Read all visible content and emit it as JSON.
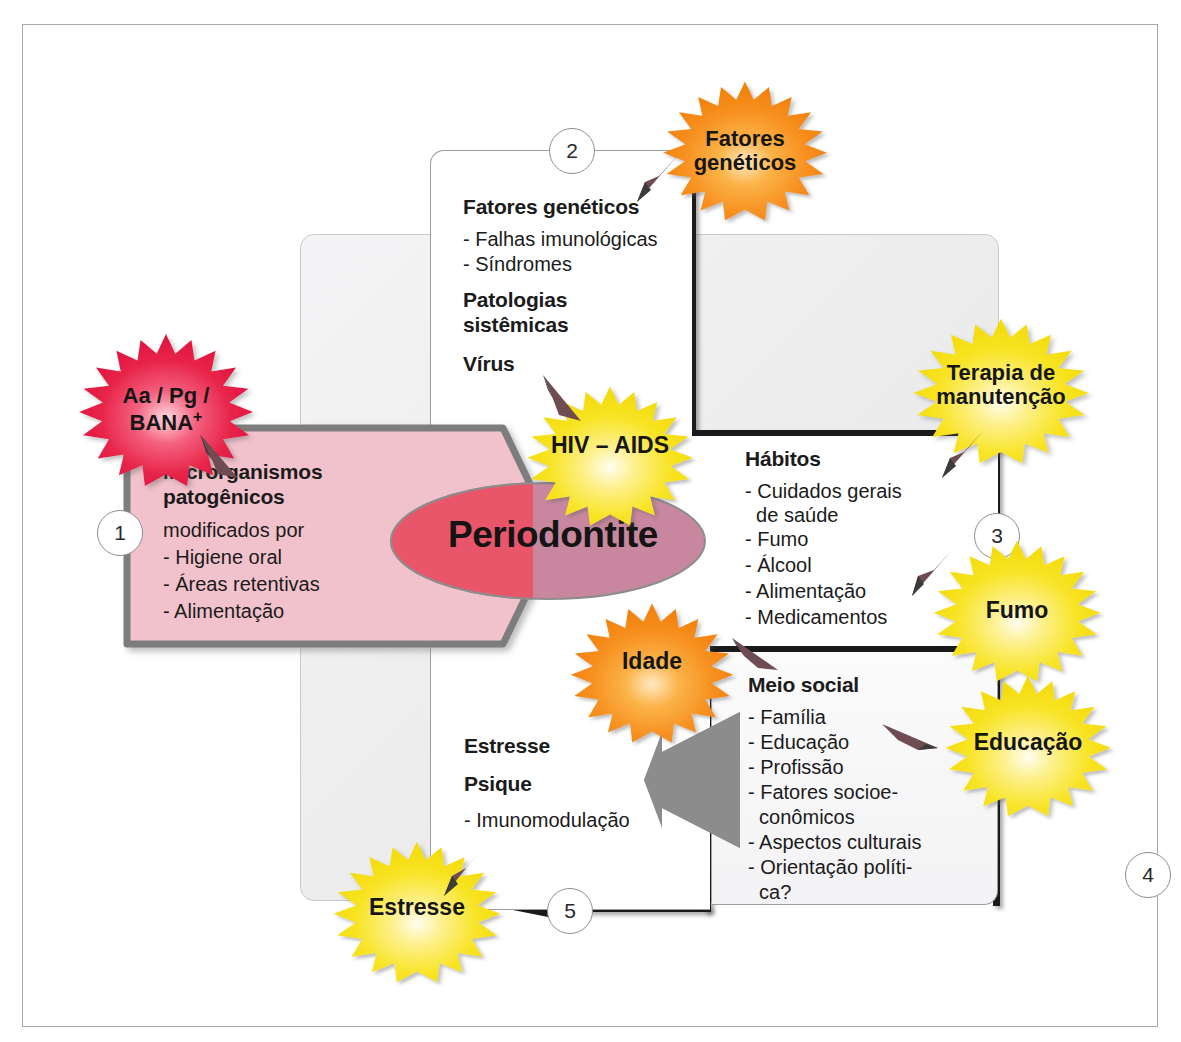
{
  "diagram": {
    "title": "Periodontite",
    "center_label": "Periodontite",
    "colors": {
      "red_burst": "#e8254a",
      "orange_burst": "#f79020",
      "yellow_burst": "#f7e11e",
      "pink_polygon": "#f2c2cc",
      "ellipse": "#c9879f",
      "ellipse_overlap": "#e9566a",
      "gray_panel": "#ececee",
      "frame_border": "#a8a8a8",
      "connector": "#1a1a1a"
    },
    "boxes": [
      {
        "id": "microorganisms",
        "number": "1",
        "heading": "Microrganismos\npatogênicos",
        "heading_line1": "Microrganismos",
        "heading_line2": "patogênicos",
        "subtitle": "modificados por",
        "items": [
          "- Higiene oral",
          "- Áreas retentivas",
          "- Alimentação"
        ]
      },
      {
        "id": "genetic",
        "number": "2",
        "heading": "Fatores genéticos",
        "items": [
          "- Falhas imunológicas",
          "- Síndromes"
        ],
        "heading2_line1": "Patologias",
        "heading2_line2": "sistêmicas",
        "heading3": "Vírus"
      },
      {
        "id": "habits",
        "number": "3",
        "heading": "Hábitos",
        "items": [
          "- Cuidados gerais",
          "  de saúde",
          "- Fumo",
          "- Álcool",
          "- Alimentação",
          "- Medicamentos"
        ]
      },
      {
        "id": "social",
        "number": "4",
        "heading": "Meio social",
        "items": [
          "- Família",
          "- Educação",
          "- Profissão",
          "- Fatores socioe-",
          "  conômicos",
          "- Aspectos culturais",
          "- Orientação políti-",
          "  ca?"
        ]
      },
      {
        "id": "stress",
        "number": "5",
        "heading1": "Estresse",
        "heading2": "Psique",
        "items": [
          "- Imunomodulação"
        ]
      }
    ],
    "bursts": [
      {
        "id": "bana",
        "label_line1": "Aa / Pg /",
        "label_line2": "BANA",
        "sup": "+",
        "color": "red"
      },
      {
        "id": "genetic-factors",
        "label_line1": "Fatores",
        "label_line2": "genéticos",
        "color": "orange"
      },
      {
        "id": "hiv",
        "label_line1": "HIV – AIDS",
        "color": "yellow"
      },
      {
        "id": "therapy",
        "label_line1": "Terapia de",
        "label_line2": "manutenção",
        "color": "yellow"
      },
      {
        "id": "smoking",
        "label_line1": "Fumo",
        "color": "yellow"
      },
      {
        "id": "age",
        "label_line1": "Idade",
        "color": "orange"
      },
      {
        "id": "education",
        "label_line1": "Educação",
        "color": "yellow"
      },
      {
        "id": "stress-burst",
        "label_line1": "Estresse",
        "color": "yellow"
      }
    ],
    "numbers": [
      "1",
      "2",
      "3",
      "4",
      "5"
    ]
  }
}
